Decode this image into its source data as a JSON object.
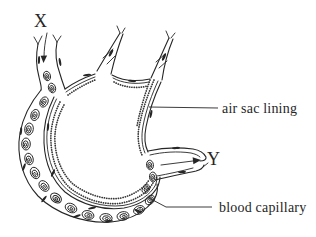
{
  "figure": {
    "background": "#ffffff",
    "ink_color": "#262626",
    "labels": {
      "x_marker": "X",
      "y_marker": "Y",
      "air_sac_lining": "air sac lining",
      "blood_capillary": "blood capillary"
    }
  }
}
